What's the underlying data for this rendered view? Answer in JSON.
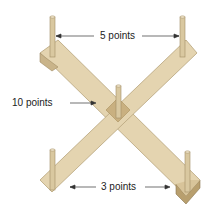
{
  "diagram": {
    "labels": {
      "top": "5 points",
      "middle": "10 points",
      "bottom": "3 points"
    },
    "colors": {
      "wood": "#e4d4b0",
      "wood_edge": "#b8a47c",
      "wood_dark": "#c9b48a",
      "center": "#c9b080",
      "peg": "#d9c8a0",
      "arrow": "#333333"
    }
  }
}
